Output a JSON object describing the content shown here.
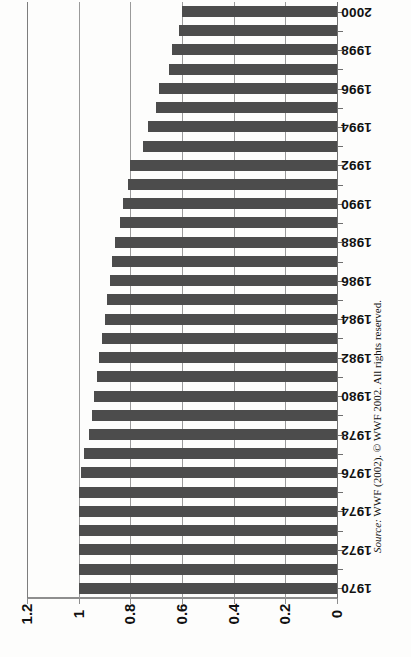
{
  "chart_data": {
    "type": "bar",
    "orientation": "horizontal",
    "title": "",
    "subtitle": "",
    "xlabel": "",
    "ylabel": "",
    "xlim": [
      0,
      1.2
    ],
    "x_reversed": true,
    "grid": true,
    "legend": null,
    "bar_color": "#4c4c4c",
    "axis_color": "#8e8e8e",
    "xticks": [
      "1.2",
      "1",
      "0.8",
      "0.6",
      "0.4",
      "0.2",
      "0"
    ],
    "xtick_values": [
      1.2,
      1.0,
      0.8,
      0.6,
      0.4,
      0.2,
      0
    ],
    "categories": [
      "2000",
      "1999",
      "1998",
      "1997",
      "1996",
      "1995",
      "1994",
      "1993",
      "1992",
      "1991",
      "1990",
      "1989",
      "1988",
      "1987",
      "1986",
      "1985",
      "1984",
      "1983",
      "1982",
      "1981",
      "1980",
      "1979",
      "1978",
      "1977",
      "1976",
      "1975",
      "1974",
      "1973",
      "1972",
      "1971",
      "1970"
    ],
    "values": [
      0.6,
      0.61,
      0.64,
      0.65,
      0.69,
      0.7,
      0.73,
      0.75,
      0.8,
      0.81,
      0.83,
      0.84,
      0.86,
      0.87,
      0.88,
      0.89,
      0.9,
      0.91,
      0.92,
      0.93,
      0.94,
      0.95,
      0.96,
      0.98,
      0.99,
      1.0,
      1.0,
      1.0,
      1.0,
      1.0,
      1.0
    ],
    "visible_year_labels": [
      "2000",
      "1998",
      "1996",
      "1994",
      "1992",
      "1990",
      "1988",
      "1986",
      "1984",
      "1982",
      "1980",
      "1978",
      "1976",
      "1974",
      "1972",
      "1970"
    ]
  },
  "source": {
    "prefix": "Source:",
    "text": "WWF (2002). © WWF 2002. All rights reserved."
  }
}
